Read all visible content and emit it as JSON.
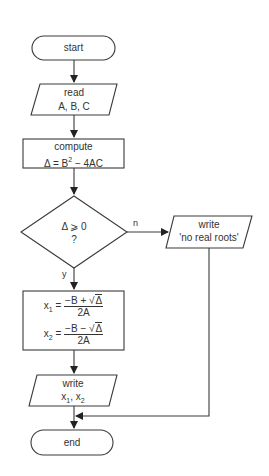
{
  "diagram": {
    "type": "flowchart",
    "nodes": [
      {
        "id": "start",
        "shape": "terminal",
        "text": "start"
      },
      {
        "id": "read",
        "shape": "parallelogram",
        "line1": "read",
        "line2": "A, B, C"
      },
      {
        "id": "compute",
        "shape": "process",
        "line1": "compute",
        "line2_prefix": "Δ = B",
        "line2_exp": "2",
        "line2_suffix": " − 4AC"
      },
      {
        "id": "decision",
        "shape": "diamond",
        "line1": "Δ ⩾ 0",
        "line2": "?"
      },
      {
        "id": "no_roots",
        "shape": "parallelogram",
        "line1": "write",
        "line2": "'no real roots'"
      },
      {
        "id": "roots",
        "shape": "process",
        "x1": {
          "var": "x",
          "sub": "1",
          "eq": "=",
          "num_left": "−B + ",
          "radicand": "Δ",
          "den": "2A"
        },
        "x2": {
          "var": "x",
          "sub": "2",
          "eq": "=",
          "num_left": "−B − ",
          "radicand": "Δ",
          "den": "2A"
        }
      },
      {
        "id": "write_roots",
        "shape": "parallelogram",
        "line1": "write",
        "var": "x",
        "sub1": "1",
        "sep": ", ",
        "sub2": "2"
      },
      {
        "id": "end",
        "shape": "terminal",
        "text": "end"
      }
    ],
    "edges": [
      {
        "from": "start",
        "to": "read",
        "label": ""
      },
      {
        "from": "read",
        "to": "compute",
        "label": ""
      },
      {
        "from": "compute",
        "to": "decision",
        "label": ""
      },
      {
        "from": "decision",
        "to": "no_roots",
        "label": "n"
      },
      {
        "from": "decision",
        "to": "roots",
        "label": "y"
      },
      {
        "from": "roots",
        "to": "write_roots",
        "label": ""
      },
      {
        "from": "write_roots",
        "to": "end",
        "label": ""
      },
      {
        "from": "no_roots",
        "to": "end",
        "label": ""
      }
    ]
  }
}
